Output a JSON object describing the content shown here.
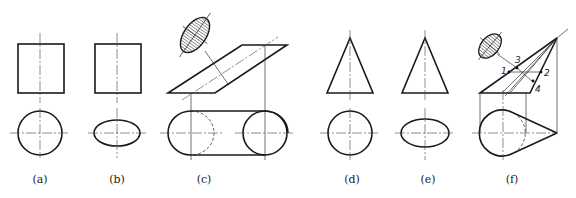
{
  "figure": {
    "panels": [
      {
        "id": "a",
        "label": "(a)",
        "shape": "cylinder",
        "top_view": "circle"
      },
      {
        "id": "b",
        "label": "(b)",
        "shape": "cylinder",
        "top_view": "ellipse"
      },
      {
        "id": "c",
        "label": "(c)",
        "shape": "inclined cylinder with oblique section",
        "top_view": "slot with two circles"
      },
      {
        "id": "d",
        "label": "(d)",
        "shape": "cone",
        "top_view": "circle"
      },
      {
        "id": "e",
        "label": "(e)",
        "shape": "cone",
        "top_view": "ellipse"
      },
      {
        "id": "f",
        "label": "(f)",
        "shape": "oblique cone with section",
        "top_view": "circle with tangents to apex"
      }
    ],
    "point_labels": [
      "1",
      "2",
      "3",
      "4"
    ],
    "colors": {
      "line": "#1a1a1a",
      "hatch": "#333333",
      "background": "#ffffff"
    }
  }
}
